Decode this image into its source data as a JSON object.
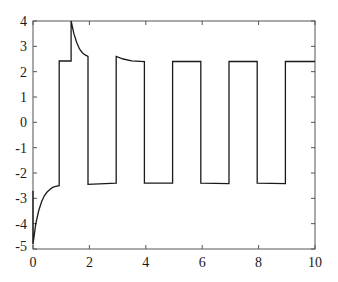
{
  "chart_data": {
    "type": "line",
    "title": "",
    "xlabel": "",
    "ylabel": "",
    "xlim": [
      0,
      10
    ],
    "ylim": [
      -5,
      4
    ],
    "grid": false,
    "legend": null,
    "x_ticks": [
      0,
      2,
      4,
      6,
      8,
      10
    ],
    "x_tick_labels": [
      "0",
      "2",
      "4",
      "6",
      "8",
      "10"
    ],
    "y_ticks": [
      4,
      3,
      2,
      1,
      0,
      -1,
      -2,
      -3,
      -4,
      -5
    ],
    "y_tick_labels": [
      "4",
      "3",
      "2",
      "1",
      "0",
      "-1",
      "-2",
      "-3",
      "-4",
      "-5"
    ],
    "series": [
      {
        "name": "signal",
        "color": "#1a1a1a",
        "points": [
          [
            0.0,
            -2.7
          ],
          [
            0.0,
            -4.8
          ],
          [
            0.05,
            -4.4
          ],
          [
            0.1,
            -4.0
          ],
          [
            0.2,
            -3.5
          ],
          [
            0.3,
            -3.15
          ],
          [
            0.4,
            -2.9
          ],
          [
            0.5,
            -2.75
          ],
          [
            0.6,
            -2.65
          ],
          [
            0.7,
            -2.57
          ],
          [
            0.8,
            -2.53
          ],
          [
            0.93,
            -2.5
          ],
          [
            0.93,
            2.42
          ],
          [
            1.35,
            2.42
          ],
          [
            1.35,
            4.0
          ],
          [
            1.45,
            3.5
          ],
          [
            1.55,
            3.15
          ],
          [
            1.65,
            2.9
          ],
          [
            1.75,
            2.75
          ],
          [
            1.85,
            2.66
          ],
          [
            1.95,
            2.6
          ],
          [
            1.95,
            -2.45
          ],
          [
            2.95,
            -2.4
          ],
          [
            2.95,
            2.6
          ],
          [
            3.2,
            2.5
          ],
          [
            3.5,
            2.43
          ],
          [
            3.95,
            2.4
          ],
          [
            3.95,
            -2.4
          ],
          [
            4.95,
            -2.4
          ],
          [
            4.95,
            2.4
          ],
          [
            5.95,
            2.4
          ],
          [
            5.95,
            -2.4
          ],
          [
            6.95,
            -2.42
          ],
          [
            6.95,
            2.4
          ],
          [
            7.95,
            2.4
          ],
          [
            7.95,
            -2.4
          ],
          [
            8.95,
            -2.42
          ],
          [
            8.95,
            2.4
          ],
          [
            10.0,
            2.4
          ]
        ]
      }
    ]
  }
}
